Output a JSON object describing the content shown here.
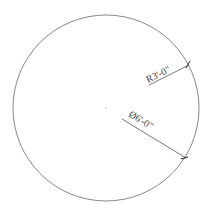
{
  "drawing": {
    "shape": "circle",
    "center": {
      "x": 106,
      "y": 108
    },
    "radius_px": 93,
    "stroke_color": "#7a7a7a",
    "dimensions": {
      "radius": {
        "label": "R3'-0\"",
        "color": "#444444"
      },
      "diameter": {
        "label": "Ø6'-0\"",
        "color": "#444444"
      }
    }
  }
}
